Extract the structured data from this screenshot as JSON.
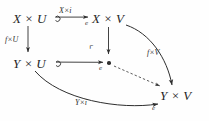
{
  "diagram": {
    "type": "commutative-diagram",
    "background_color": "#fefefe",
    "ink_color": "#2b2b2b",
    "nodes": [
      {
        "id": "top_left",
        "label": "X × U"
      },
      {
        "id": "top_right",
        "label": "X × V"
      },
      {
        "id": "mid_left",
        "label": "Y × U"
      },
      {
        "id": "mid_center",
        "label": "•"
      },
      {
        "id": "bottom_right",
        "label": "Y × V"
      }
    ],
    "edges": [
      {
        "id": "top_horizontal",
        "from": "top_left",
        "to": "top_right",
        "style": "hooked-arrow",
        "label": "X×i",
        "sublabel": "e"
      },
      {
        "id": "left_vertical",
        "from": "top_left",
        "to": "mid_left",
        "style": "arrow",
        "label": "f×U",
        "sublabel": ""
      },
      {
        "id": "center_vertical",
        "from": "top_right",
        "to": "mid_center",
        "style": "arrow",
        "label": "",
        "sublabel": ""
      },
      {
        "id": "mid_horizontal",
        "from": "mid_left",
        "to": "mid_center",
        "style": "hooked-arrow",
        "label": "",
        "sublabel": "e"
      },
      {
        "id": "right_curve",
        "from": "top_right",
        "to": "bottom_right",
        "style": "curved-arrow",
        "label": "f×V",
        "sublabel": ""
      },
      {
        "id": "diagonal_dashed",
        "from": "mid_center",
        "to": "bottom_right",
        "style": "dashed-arrow",
        "label": "",
        "sublabel": ""
      },
      {
        "id": "bottom_curve",
        "from": "mid_left",
        "to": "bottom_right",
        "style": "curved-arrow",
        "label": "Y×i",
        "sublabel": "e"
      }
    ],
    "markers": [
      {
        "id": "pullback_corner",
        "symbol": "⌜",
        "at": "mid_center"
      }
    ]
  }
}
